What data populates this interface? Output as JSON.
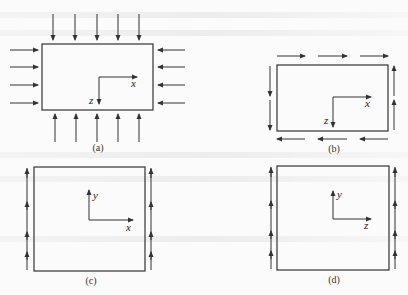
{
  "figure": {
    "colors": {
      "stroke": "#333333",
      "background": "#fbfbfb",
      "text": "#222222"
    },
    "panels": [
      {
        "id": "a",
        "caption": "(a)",
        "loading": "compression on all four edges (arrows pointing inward)",
        "axes": {
          "horizontal": "x",
          "vertical": "z",
          "vertical_direction": "down"
        }
      },
      {
        "id": "b",
        "caption": "(b)",
        "loading": "shear along edges (top right, bottom left, left down, right up)",
        "axes": {
          "horizontal": "x",
          "vertical": "z",
          "vertical_direction": "down"
        }
      },
      {
        "id": "c",
        "caption": "(c)",
        "loading": "upward shear along left and right edges",
        "axes": {
          "horizontal": "x",
          "vertical": "y",
          "vertical_direction": "up"
        }
      },
      {
        "id": "d",
        "caption": "(d)",
        "loading": "upward shear along left and right edges",
        "axes": {
          "horizontal": "z",
          "vertical": "y",
          "vertical_direction": "up"
        }
      }
    ]
  }
}
